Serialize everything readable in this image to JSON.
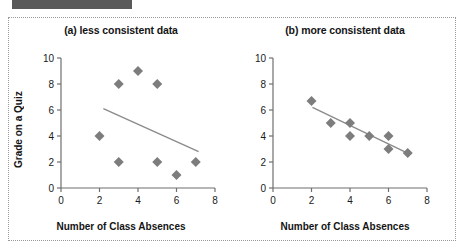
{
  "header": {
    "bar_color": "#5a5a5a"
  },
  "figure": {
    "border_style": "dotted",
    "border_color": "#9a9a9a",
    "background": "#ffffff"
  },
  "chart_data": [
    {
      "type": "scatter",
      "panel_id": "a",
      "title": "(a) less consistent data",
      "xlabel": "Number of Class Absences",
      "ylabel": "Grade on a Quiz",
      "xlim": [
        0,
        8
      ],
      "ylim": [
        0,
        10
      ],
      "xticks": [
        0,
        2,
        4,
        6,
        8
      ],
      "yticks": [
        0,
        2,
        4,
        6,
        8,
        10
      ],
      "xtick_labels": [
        "0",
        "2",
        "4",
        "6",
        "8"
      ],
      "ytick_labels": [
        "0",
        "2",
        "4",
        "6",
        "8",
        "10"
      ],
      "grid": false,
      "legend": false,
      "marker": "diamond",
      "marker_color": "#7d7d7d",
      "points": [
        {
          "x": 2,
          "y": 4
        },
        {
          "x": 3,
          "y": 8
        },
        {
          "x": 3,
          "y": 2
        },
        {
          "x": 4,
          "y": 9
        },
        {
          "x": 5,
          "y": 8
        },
        {
          "x": 5,
          "y": 2
        },
        {
          "x": 6,
          "y": 1
        },
        {
          "x": 7,
          "y": 2
        }
      ],
      "trendline": {
        "x0": 2.2,
        "y0": 6.1,
        "x1": 7.15,
        "y1": 2.8,
        "color": "#8a8a8a"
      }
    },
    {
      "type": "scatter",
      "panel_id": "b",
      "title": "(b) more consistent data",
      "xlabel": "Number of Class Absences",
      "ylabel": "",
      "xlim": [
        0,
        8
      ],
      "ylim": [
        0,
        10
      ],
      "xticks": [
        0,
        2,
        4,
        6,
        8
      ],
      "yticks": [
        0,
        2,
        4,
        6,
        8,
        10
      ],
      "xtick_labels": [
        "0",
        "2",
        "4",
        "6",
        "8"
      ],
      "ytick_labels": [
        "0",
        "2",
        "4",
        "6",
        "8",
        "10"
      ],
      "grid": false,
      "legend": false,
      "marker": "diamond",
      "marker_color": "#7d7d7d",
      "points": [
        {
          "x": 2,
          "y": 6.7
        },
        {
          "x": 3,
          "y": 5.0
        },
        {
          "x": 4,
          "y": 5.0
        },
        {
          "x": 4,
          "y": 4.0
        },
        {
          "x": 5,
          "y": 4.0
        },
        {
          "x": 6,
          "y": 4.0
        },
        {
          "x": 6,
          "y": 3.0
        },
        {
          "x": 7,
          "y": 2.7
        }
      ],
      "trendline": {
        "x0": 2.05,
        "y0": 6.2,
        "x1": 7.1,
        "y1": 2.6,
        "color": "#8a8a8a"
      }
    }
  ]
}
